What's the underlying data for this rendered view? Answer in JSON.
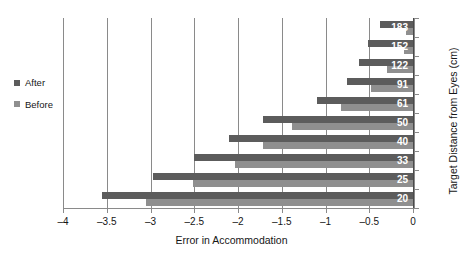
{
  "chart_data": {
    "type": "bar",
    "orientation": "horizontal",
    "title": "",
    "xlabel": "Error in Accommodation",
    "ylabel": "Target Distance from Eyes (cm)",
    "categories": [
      "183",
      "152",
      "122",
      "91",
      "61",
      "50",
      "40",
      "33",
      "25",
      "20"
    ],
    "xlim": [
      -4,
      0
    ],
    "xticks": [
      -4,
      -3.5,
      -3,
      -2.5,
      -2,
      -1.5,
      -1,
      -0.5,
      0
    ],
    "xticklabels": [
      "–4",
      "–3.5",
      "–3",
      "–2.5",
      "–2",
      "–1.5",
      "–1",
      "–0.5",
      "0"
    ],
    "grid": true,
    "grid_axis": "x",
    "legend_position": "left-outside",
    "series": [
      {
        "name": "After",
        "color": "#5c5c5c",
        "values": [
          -0.38,
          -0.52,
          -0.62,
          -0.75,
          -1.1,
          -1.72,
          -2.1,
          -2.5,
          -2.97,
          -3.55
        ]
      },
      {
        "name": "Before",
        "color": "#8f8f8f",
        "values": [
          -0.08,
          -0.1,
          -0.3,
          -0.48,
          -0.82,
          -1.38,
          -1.72,
          -2.03,
          -2.52,
          -3.05
        ]
      }
    ]
  },
  "legend": {
    "entries": [
      {
        "label": "After",
        "color": "#5c5c5c"
      },
      {
        "label": "Before",
        "color": "#8f8f8f"
      }
    ]
  },
  "axes": {
    "x_title": "Error in Accommodation",
    "y_title": "Target Distance from Eyes (cm)"
  },
  "colors": {
    "after": "#5c5c5c",
    "before": "#8f8f8f",
    "grid": "#8a8a8a",
    "axis": "#8a8a8a",
    "label_text": "#ffffff",
    "background": "#ffffff"
  }
}
